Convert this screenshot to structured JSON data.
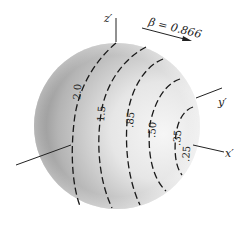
{
  "figure": {
    "velocity_label": "β = 0.866",
    "axes": {
      "z": "z′",
      "y": "y′",
      "x": "x′"
    },
    "contours": [
      {
        "label": "2.0"
      },
      {
        "label": "1.5"
      },
      {
        "label": ".85"
      },
      {
        "label": ".50"
      },
      {
        "label": ".35"
      },
      {
        "label": ".25"
      }
    ],
    "colors": {
      "sphere_light": "#f4f4f4",
      "sphere_dark": "#6e6e6e",
      "line": "#1a1a1a"
    }
  }
}
